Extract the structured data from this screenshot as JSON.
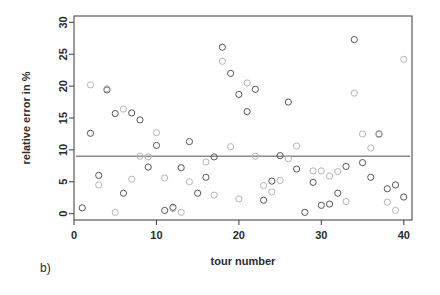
{
  "figure": {
    "panel_label": "b)",
    "background": "#ffffff",
    "frame_color": "#4a4a4a"
  },
  "chart_data": {
    "type": "scatter",
    "title": "",
    "subtitle": "",
    "xlabel": "tour number",
    "ylabel": "relative error in %",
    "xlim": [
      0,
      41
    ],
    "ylim": [
      -1,
      31
    ],
    "xticks": [
      0,
      10,
      20,
      30,
      40
    ],
    "yticks": [
      0,
      5,
      10,
      15,
      20,
      25,
      30
    ],
    "grid": false,
    "legend": "none",
    "annotations": [
      {
        "type": "hline",
        "label": "mean relative error",
        "y": 9.0,
        "color": "#8a8a8a"
      }
    ],
    "series": [
      {
        "name": "series-dark",
        "marker": "open-circle",
        "color": "#555555",
        "points": [
          {
            "x": 1,
            "y": 0.9
          },
          {
            "x": 2,
            "y": 12.6
          },
          {
            "x": 3,
            "y": 6.0
          },
          {
            "x": 4,
            "y": 19.4
          },
          {
            "x": 5,
            "y": 15.7
          },
          {
            "x": 6,
            "y": 3.2
          },
          {
            "x": 7,
            "y": 15.8
          },
          {
            "x": 8,
            "y": 14.7
          },
          {
            "x": 9,
            "y": 7.3
          },
          {
            "x": 10,
            "y": 10.7
          },
          {
            "x": 11,
            "y": 0.5
          },
          {
            "x": 12,
            "y": 1.0
          },
          {
            "x": 13,
            "y": 7.2
          },
          {
            "x": 14,
            "y": 11.3
          },
          {
            "x": 15,
            "y": 3.2
          },
          {
            "x": 16,
            "y": 5.7
          },
          {
            "x": 17,
            "y": 8.9
          },
          {
            "x": 18,
            "y": 26.1
          },
          {
            "x": 19,
            "y": 22.0
          },
          {
            "x": 20,
            "y": 18.7
          },
          {
            "x": 21,
            "y": 16.0
          },
          {
            "x": 22,
            "y": 19.5
          },
          {
            "x": 23,
            "y": 2.1
          },
          {
            "x": 24,
            "y": 5.1
          },
          {
            "x": 25,
            "y": 9.1
          },
          {
            "x": 26,
            "y": 17.5
          },
          {
            "x": 27,
            "y": 7.0
          },
          {
            "x": 28,
            "y": 0.2
          },
          {
            "x": 29,
            "y": 4.9
          },
          {
            "x": 30,
            "y": 1.3
          },
          {
            "x": 31,
            "y": 1.5
          },
          {
            "x": 32,
            "y": 3.2
          },
          {
            "x": 33,
            "y": 7.4
          },
          {
            "x": 34,
            "y": 27.3
          },
          {
            "x": 35,
            "y": 8.0
          },
          {
            "x": 36,
            "y": 5.7
          },
          {
            "x": 37,
            "y": 12.5
          },
          {
            "x": 38,
            "y": 3.9
          },
          {
            "x": 39,
            "y": 4.5
          },
          {
            "x": 40,
            "y": 2.6
          }
        ]
      },
      {
        "name": "series-light",
        "marker": "open-circle",
        "color": "#b5b5b5",
        "points": [
          {
            "x": 2,
            "y": 20.2
          },
          {
            "x": 3,
            "y": 4.5
          },
          {
            "x": 4,
            "y": 19.6
          },
          {
            "x": 5,
            "y": 0.2
          },
          {
            "x": 6,
            "y": 16.4
          },
          {
            "x": 7,
            "y": 5.4
          },
          {
            "x": 8,
            "y": 9.0
          },
          {
            "x": 9,
            "y": 8.9
          },
          {
            "x": 10,
            "y": 12.7
          },
          {
            "x": 11,
            "y": 5.6
          },
          {
            "x": 12,
            "y": 0.8
          },
          {
            "x": 13,
            "y": 0.2
          },
          {
            "x": 14,
            "y": 5.0
          },
          {
            "x": 16,
            "y": 8.1
          },
          {
            "x": 17,
            "y": 2.9
          },
          {
            "x": 18,
            "y": 23.9
          },
          {
            "x": 19,
            "y": 10.5
          },
          {
            "x": 20,
            "y": 2.3
          },
          {
            "x": 21,
            "y": 20.5
          },
          {
            "x": 22,
            "y": 9.0
          },
          {
            "x": 23,
            "y": 4.4
          },
          {
            "x": 24,
            "y": 3.4
          },
          {
            "x": 25,
            "y": 5.2
          },
          {
            "x": 26,
            "y": 8.6
          },
          {
            "x": 27,
            "y": 10.6
          },
          {
            "x": 29,
            "y": 6.7
          },
          {
            "x": 30,
            "y": 6.7
          },
          {
            "x": 31,
            "y": 5.9
          },
          {
            "x": 32,
            "y": 6.6
          },
          {
            "x": 33,
            "y": 1.9
          },
          {
            "x": 34,
            "y": 18.9
          },
          {
            "x": 35,
            "y": 12.5
          },
          {
            "x": 36,
            "y": 10.3
          },
          {
            "x": 37,
            "y": 12.4
          },
          {
            "x": 38,
            "y": 1.8
          },
          {
            "x": 39,
            "y": 0.5
          },
          {
            "x": 40,
            "y": 24.2
          }
        ]
      }
    ]
  }
}
